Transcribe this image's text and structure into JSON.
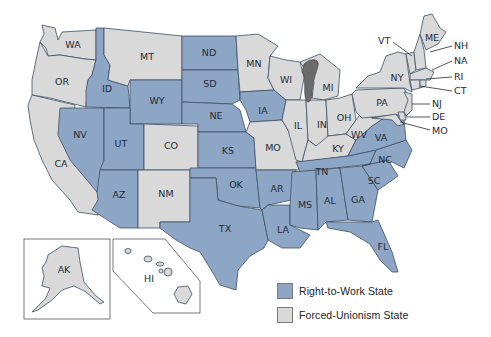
{
  "colors": {
    "right_to_work": "#8ea6c6",
    "forced_unionism": "#d9d9d9",
    "border": "#3d4f63",
    "lake": "#6b6b6b"
  },
  "legend": {
    "items": [
      {
        "label": "Right-to-Work State",
        "color": "#8ea6c6"
      },
      {
        "label": "Forced-Unionism State",
        "color": "#d9d9d9"
      }
    ]
  },
  "states": {
    "WA": {
      "label": "WA",
      "status": "forced_unionism"
    },
    "OR": {
      "label": "OR",
      "status": "forced_unionism"
    },
    "CA": {
      "label": "CA",
      "status": "forced_unionism"
    },
    "ID": {
      "label": "ID",
      "status": "right_to_work"
    },
    "NV": {
      "label": "NV",
      "status": "right_to_work"
    },
    "MT": {
      "label": "MT",
      "status": "forced_unionism"
    },
    "WY": {
      "label": "WY",
      "status": "right_to_work"
    },
    "UT": {
      "label": "UT",
      "status": "right_to_work"
    },
    "AZ": {
      "label": "AZ",
      "status": "right_to_work"
    },
    "CO": {
      "label": "CO",
      "status": "forced_unionism"
    },
    "NM": {
      "label": "NM",
      "status": "forced_unionism"
    },
    "ND": {
      "label": "ND",
      "status": "right_to_work"
    },
    "SD": {
      "label": "SD",
      "status": "right_to_work"
    },
    "NE": {
      "label": "NE",
      "status": "right_to_work"
    },
    "KS": {
      "label": "KS",
      "status": "right_to_work"
    },
    "OK": {
      "label": "OK",
      "status": "right_to_work"
    },
    "TX": {
      "label": "TX",
      "status": "right_to_work"
    },
    "MN": {
      "label": "MN",
      "status": "forced_unionism"
    },
    "IA": {
      "label": "IA",
      "status": "right_to_work"
    },
    "MO": {
      "label": "MO",
      "status": "forced_unionism"
    },
    "AR": {
      "label": "AR",
      "status": "right_to_work"
    },
    "LA": {
      "label": "LA",
      "status": "right_to_work"
    },
    "WI": {
      "label": "WI",
      "status": "forced_unionism"
    },
    "IL": {
      "label": "IL",
      "status": "forced_unionism"
    },
    "MI": {
      "label": "MI",
      "status": "forced_unionism"
    },
    "IN": {
      "label": "IN",
      "status": "forced_unionism"
    },
    "OH": {
      "label": "OH",
      "status": "forced_unionism"
    },
    "KY": {
      "label": "KY",
      "status": "forced_unionism"
    },
    "TN": {
      "label": "TN",
      "status": "right_to_work"
    },
    "MS": {
      "label": "MS",
      "status": "right_to_work"
    },
    "AL": {
      "label": "AL",
      "status": "right_to_work"
    },
    "GA": {
      "label": "GA",
      "status": "right_to_work"
    },
    "FL": {
      "label": "FL",
      "status": "right_to_work"
    },
    "SC": {
      "label": "SC",
      "status": "right_to_work"
    },
    "NC": {
      "label": "NC",
      "status": "right_to_work"
    },
    "VA": {
      "label": "VA",
      "status": "right_to_work"
    },
    "WV": {
      "label": "WV",
      "status": "forced_unionism"
    },
    "PA": {
      "label": "PA",
      "status": "forced_unionism"
    },
    "NY": {
      "label": "NY",
      "status": "forced_unionism"
    },
    "VT": {
      "label": "VT",
      "status": "forced_unionism"
    },
    "NH": {
      "label": "NH",
      "status": "forced_unionism"
    },
    "ME": {
      "label": "ME",
      "status": "forced_unionism"
    },
    "NA": {
      "label": "NA",
      "status": "forced_unionism"
    },
    "RI": {
      "label": "RI",
      "status": "forced_unionism"
    },
    "CT": {
      "label": "CT",
      "status": "forced_unionism"
    },
    "NJ": {
      "label": "NJ",
      "status": "forced_unionism"
    },
    "DE": {
      "label": "DE",
      "status": "forced_unionism"
    },
    "MO_EAST": {
      "label": "MO",
      "status": "forced_unionism"
    },
    "AK": {
      "label": "AK",
      "status": "forced_unionism"
    },
    "HI": {
      "label": "HI",
      "status": "forced_unionism"
    }
  }
}
